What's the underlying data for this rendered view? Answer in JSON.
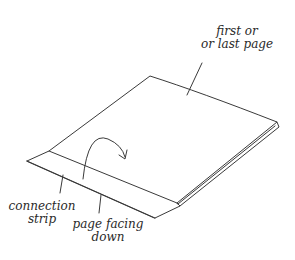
{
  "diagram": {
    "labels": {
      "first_or_last_page": {
        "line1": "first or",
        "line2": "or last page"
      },
      "connection_strip": {
        "line1": "connection",
        "line2": "strip"
      },
      "page_facing_down": {
        "line1": "page facing",
        "line2": "down"
      }
    },
    "elements": [
      "page-sheet",
      "connection-strip",
      "curved-arrow",
      "leader-lines"
    ],
    "stroke_color": "#3a3a3a"
  }
}
